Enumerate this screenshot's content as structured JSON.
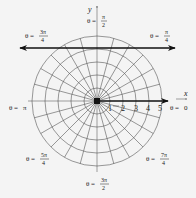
{
  "diagram": {
    "type": "polar-grid",
    "center": {
      "x": 97,
      "y": 101
    },
    "unit_px": 13,
    "circle_radii_units": [
      1,
      2,
      3,
      4,
      5
    ],
    "ray_spacing_deg": 15,
    "axis_labels": {
      "x": "x",
      "y": "y"
    },
    "radial_ticks": [
      "1",
      "2",
      "3",
      "4",
      "5"
    ],
    "angle_labels": [
      {
        "id": "theta-0",
        "prefix": "θ = ",
        "num": "0",
        "den": ""
      },
      {
        "id": "theta-pi-4",
        "prefix": "θ = ",
        "num": "π",
        "den": "4"
      },
      {
        "id": "theta-pi-2",
        "prefix": "θ = ",
        "num": "π",
        "den": "2"
      },
      {
        "id": "theta-3pi-4",
        "prefix": "θ = ",
        "num": "3π",
        "den": "4"
      },
      {
        "id": "theta-pi",
        "prefix": "θ = ",
        "num": "π",
        "den": ""
      },
      {
        "id": "theta-5pi-4",
        "prefix": "θ = ",
        "num": "5π",
        "den": "4"
      },
      {
        "id": "theta-3pi-2",
        "prefix": "θ = ",
        "num": "3π",
        "den": "2"
      },
      {
        "id": "theta-7pi-4",
        "prefix": "θ = ",
        "num": "7π",
        "den": "4"
      }
    ],
    "bold_line": {
      "description": "horizontal line with arrows at both ends",
      "y": 48,
      "x1": 20,
      "x2": 175
    },
    "bold_ray": {
      "description": "ray along θ = 0 from origin",
      "x2": 168
    }
  },
  "colors": {
    "background": "#f4f4f4",
    "ink": "#111111",
    "grid": "#555555"
  }
}
